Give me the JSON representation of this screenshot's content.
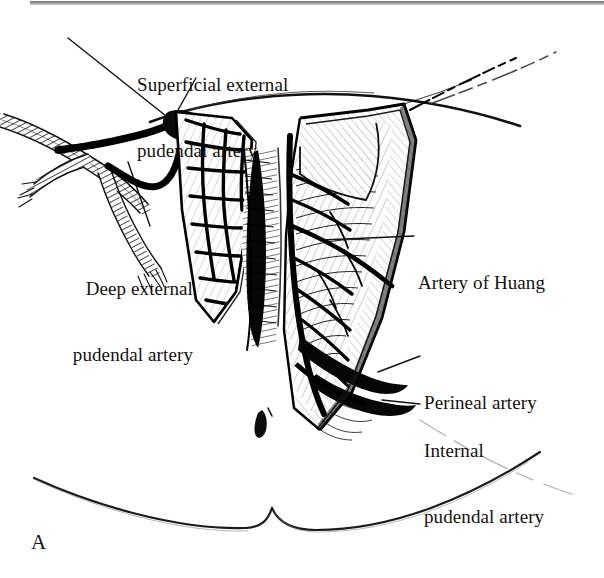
{
  "figure": {
    "panel_letter": "A",
    "background_color": "#ffffff",
    "ink_color": "#000000",
    "label_text_color": "#14120f",
    "width": 604,
    "height": 578
  },
  "labels": [
    {
      "id": "superficial-external-pudendal-artery",
      "line1": "Superficial external",
      "line2": "pudendal artery",
      "align": "left",
      "x": 137,
      "y": 30
    },
    {
      "id": "deep-external-pudendal-artery",
      "line1": "Deep external",
      "line2": "pudendal artery",
      "align": "right",
      "x": 28,
      "y": 234
    },
    {
      "id": "artery-of-huang",
      "line1": "Artery of Huang",
      "line2": "",
      "align": "left",
      "x": 418,
      "y": 228
    },
    {
      "id": "perineal-artery",
      "line1": "Perineal artery",
      "line2": "",
      "align": "left",
      "x": 424,
      "y": 348
    },
    {
      "id": "internal-pudendal-artery",
      "line1": "Internal",
      "line2": "pudendal artery",
      "align": "left",
      "x": 424,
      "y": 396
    }
  ]
}
